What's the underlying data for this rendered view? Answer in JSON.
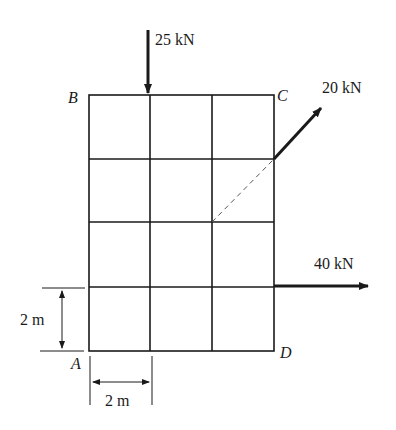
{
  "diagram": {
    "type": "force-on-grid-plate",
    "grid": {
      "columns": 3,
      "rows": 4,
      "cell_size": "2 m"
    },
    "corners": {
      "top_left": "B",
      "top_right": "C",
      "bottom_left": "A",
      "bottom_right": "D"
    },
    "forces": [
      {
        "label": "25 kN",
        "direction": "down",
        "location": "top edge, first interior gridline"
      },
      {
        "label": "20 kN",
        "direction": "up-right diagonal",
        "location": "right edge, second gridline from top"
      },
      {
        "label": "40 kN",
        "direction": "right",
        "location": "right edge, bottom interior gridline"
      }
    ],
    "dimensions": [
      {
        "label": "2 m",
        "orientation": "vertical"
      },
      {
        "label": "2 m",
        "orientation": "horizontal"
      }
    ]
  }
}
